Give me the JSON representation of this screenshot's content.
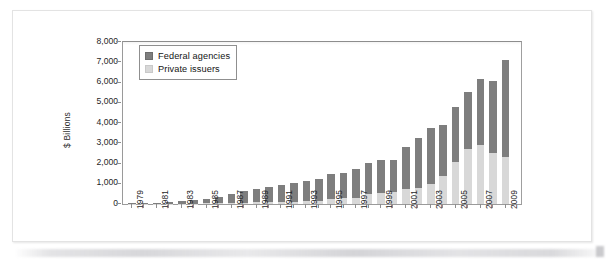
{
  "figure": {
    "y_axis_title": "$ Billions",
    "legend": {
      "items": [
        {
          "label": "Federal agencies",
          "color": "#7e7e7e",
          "swatch": "dark-gray-square-icon"
        },
        {
          "label": "Private issuers",
          "color": "#d8d8d8",
          "swatch": "light-gray-square-icon"
        }
      ]
    }
  },
  "chart_data": {
    "type": "bar",
    "stacked": true,
    "title": "",
    "subtitle": "",
    "xlabel": "",
    "ylabel": "$ Billions",
    "ylim": [
      0,
      8000
    ],
    "ytick_labels": [
      "0",
      "1,000",
      "2,000",
      "3,000",
      "4,000",
      "5,000",
      "6,000",
      "7,000",
      "8,000"
    ],
    "ytick_values": [
      0,
      1000,
      2000,
      3000,
      4000,
      5000,
      6000,
      7000,
      8000
    ],
    "grid": false,
    "legend_position": "upper-left-inside",
    "categories": [
      "1979",
      "1980",
      "1981",
      "1982",
      "1983",
      "1984",
      "1985",
      "1986",
      "1987",
      "1988",
      "1989",
      "1990",
      "1991",
      "1992",
      "1993",
      "1994",
      "1995",
      "1996",
      "1997",
      "1998",
      "1999",
      "2000",
      "2001",
      "2002",
      "2003",
      "2004",
      "2005",
      "2006",
      "2007",
      "2008",
      "2009"
    ],
    "xtick_labels_shown": [
      "1979",
      "1981",
      "1983",
      "1985",
      "1987",
      "1989",
      "1991",
      "1993",
      "1995",
      "1997",
      "1999",
      "2001",
      "2003",
      "2005",
      "2007",
      "2009"
    ],
    "series": [
      {
        "name": "Private issuers",
        "color": "#d8d8d8",
        "values": [
          5,
          8,
          10,
          14,
          18,
          25,
          35,
          50,
          60,
          70,
          80,
          90,
          100,
          110,
          130,
          160,
          250,
          290,
          320,
          470,
          540,
          600,
          720,
          800,
          1010,
          1370,
          2060,
          2700,
          2900,
          2530,
          2330
        ]
      },
      {
        "name": "Federal agencies",
        "color": "#7e7e7e",
        "values": [
          30,
          42,
          60,
          96,
          132,
          175,
          235,
          300,
          450,
          550,
          640,
          750,
          840,
          930,
          1010,
          1100,
          1250,
          1240,
          1400,
          1580,
          1630,
          1550,
          2100,
          2440,
          2720,
          2520,
          2720,
          2830,
          3260,
          3550,
          4770
        ]
      }
    ],
    "totals": [
      35,
      50,
      70,
      110,
      150,
      200,
      270,
      350,
      510,
      620,
      720,
      840,
      940,
      1040,
      1140,
      1260,
      1500,
      1530,
      1720,
      2050,
      2170,
      2150,
      2820,
      3240,
      3730,
      3890,
      4780,
      5530,
      6160,
      6080,
      7100
    ]
  },
  "render": {
    "plot": {
      "left": 122,
      "top": 41,
      "width": 398,
      "height": 162
    },
    "bar_width": 7.6,
    "first_center": 131.0,
    "spacing": 12.45
  }
}
